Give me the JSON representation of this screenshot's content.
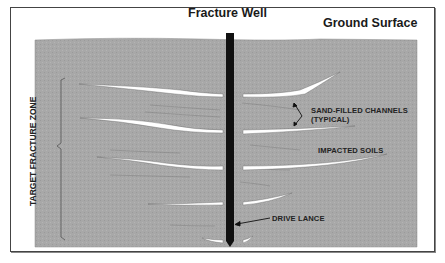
{
  "diagram": {
    "title_well": "Fracture Well",
    "title_ground": "Ground Surface",
    "labels": {
      "target_zone": "TARGET FRACTURE ZONE",
      "sand_channels_line1": "SAND-FILLED CHANNELS",
      "sand_channels_line2": "(TYPICAL)",
      "impacted_soils": "IMPACTED SOILS",
      "drive_lance": "DRIVE LANCE"
    },
    "colors": {
      "soil": "#a9a9a9",
      "well": "#111111",
      "fracture": "#ffffff",
      "frame": "#444444"
    }
  }
}
